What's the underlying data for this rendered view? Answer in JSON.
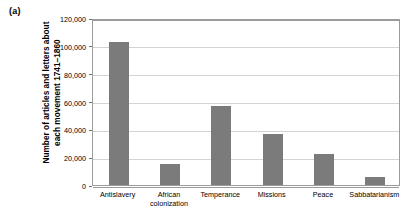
{
  "panel": {
    "letter": "(a)"
  },
  "chart_data": {
    "type": "bar",
    "title": "",
    "subtitle": "",
    "xlabel": "",
    "ylabel": "Number of articles and letters about\neach movement 1741–1860",
    "categories": [
      "Antislavery",
      "African\ncolonization",
      "Temperance",
      "Missions",
      "Peace",
      "Sabbatarianism"
    ],
    "values": [
      103000,
      15000,
      57000,
      37000,
      22000,
      6000
    ],
    "ylim": [
      0,
      120000
    ],
    "ytick_values": [
      0,
      20000,
      40000,
      60000,
      80000,
      100000,
      120000
    ],
    "ytick_labels": [
      "0",
      "20,000",
      "40,000",
      "60,000",
      "80,000",
      "100,000",
      "120,000"
    ],
    "grid": true,
    "legend": null,
    "bar_color": "#7b7b7b",
    "gridline_color": "#d3d3d3",
    "axis_color": "#9b9b9b",
    "background_color": "#ffffff"
  }
}
